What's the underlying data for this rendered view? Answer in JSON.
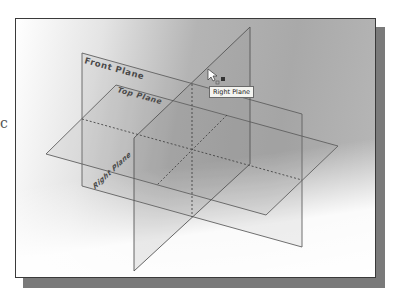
{
  "window": {
    "description": "SolidWorks graphics area showing the three default datum planes in isometric view"
  },
  "planes": [
    {
      "id": "front",
      "label": "Front Plane"
    },
    {
      "id": "top",
      "label": "Top Plane"
    },
    {
      "id": "right",
      "label": "Right Plane"
    }
  ],
  "tooltip": {
    "text": "Right Plane"
  },
  "cursor": {
    "icon": "select-arrow-icon",
    "badge": "plane-filter-icon"
  },
  "stray_text": "c",
  "colors": {
    "plane_edge": "#5e5e5e",
    "plane_fill": "#9a9a9a",
    "label": "#4a4a4a",
    "frame_border": "#3a3a3a",
    "shadow": "#7a7a7a"
  }
}
